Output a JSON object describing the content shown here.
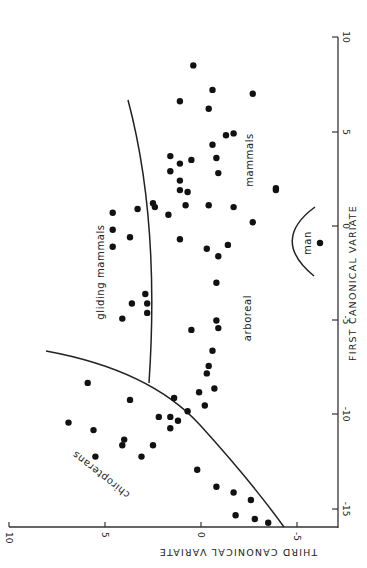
{
  "chart_data": {
    "type": "scatter",
    "title": "",
    "orientation_note": "figure printed rotated 90 degrees clockwise",
    "xlabel": "FIRST CANONICAL VARIATE",
    "ylabel": "THIRD CANONICAL VARIATE",
    "xlim": [
      -16,
      10
    ],
    "ylim": [
      -7,
      10
    ],
    "x_ticks": [
      -15,
      -10,
      -5,
      0,
      5,
      10
    ],
    "y_ticks": [
      -5,
      0,
      5,
      10
    ],
    "x_tick_labels": [
      "-15",
      "-10",
      "-5",
      "0",
      "5",
      "10"
    ],
    "y_tick_labels": [
      "-5",
      "0",
      "5",
      "10"
    ],
    "grid": false,
    "legend": null,
    "region_labels": [
      "chiropterans",
      "gliding mammals",
      "arboreal",
      "mammals",
      "man"
    ],
    "points": [
      {
        "x": 8.5,
        "y": 0.4
      },
      {
        "x": 7.2,
        "y": -0.6
      },
      {
        "x": 7.0,
        "y": -2.7
      },
      {
        "x": 6.6,
        "y": 1.1
      },
      {
        "x": 6.2,
        "y": -0.4
      },
      {
        "x": 4.8,
        "y": -1.3
      },
      {
        "x": 4.9,
        "y": -1.7
      },
      {
        "x": 4.3,
        "y": -0.6
      },
      {
        "x": 3.7,
        "y": 1.6
      },
      {
        "x": 3.3,
        "y": 1.1
      },
      {
        "x": 3.5,
        "y": 0.5
      },
      {
        "x": 3.6,
        "y": -0.8
      },
      {
        "x": 2.8,
        "y": -0.9
      },
      {
        "x": 2.0,
        "y": -3.9
      },
      {
        "x": 1.9,
        "y": -3.9
      },
      {
        "x": 2.9,
        "y": 1.6
      },
      {
        "x": 2.4,
        "y": 1.1
      },
      {
        "x": 1.9,
        "y": 1.1
      },
      {
        "x": 1.8,
        "y": 0.7
      },
      {
        "x": 1.1,
        "y": 0.8
      },
      {
        "x": 1.0,
        "y": 2.4
      },
      {
        "x": 1.1,
        "y": -0.4
      },
      {
        "x": 1.0,
        "y": -1.7
      },
      {
        "x": 0.2,
        "y": -2.7
      },
      {
        "x": 0.7,
        "y": 4.6
      },
      {
        "x": 0.9,
        "y": 3.3
      },
      {
        "x": 1.2,
        "y": 2.5
      },
      {
        "x": 0.6,
        "y": 1.7
      },
      {
        "x": -0.2,
        "y": 4.6
      },
      {
        "x": -0.6,
        "y": 3.7
      },
      {
        "x": -0.7,
        "y": 1.1
      },
      {
        "x": -1.2,
        "y": -0.3
      },
      {
        "x": -1.0,
        "y": -1.4
      },
      {
        "x": -1.6,
        "y": -0.9
      },
      {
        "x": -1.1,
        "y": 4.6
      },
      {
        "x": -3.0,
        "y": -0.8
      },
      {
        "x": -3.6,
        "y": 2.9
      },
      {
        "x": -4.1,
        "y": 2.8
      },
      {
        "x": -4.1,
        "y": 3.6
      },
      {
        "x": -4.6,
        "y": 2.8
      },
      {
        "x": -4.9,
        "y": 4.1
      },
      {
        "x": -5.0,
        "y": -0.8
      },
      {
        "x": -5.4,
        "y": -0.9
      },
      {
        "x": -5.5,
        "y": 0.5
      },
      {
        "x": -6.6,
        "y": -0.6
      },
      {
        "x": -7.4,
        "y": -0.4
      },
      {
        "x": -7.8,
        "y": -0.3
      },
      {
        "x": -8.6,
        "y": -0.7
      },
      {
        "x": -8.3,
        "y": 5.9
      },
      {
        "x": -8.8,
        "y": 0.1
      },
      {
        "x": -9.1,
        "y": 1.4
      },
      {
        "x": -9.2,
        "y": 3.7
      },
      {
        "x": -9.5,
        "y": -0.2
      },
      {
        "x": -9.8,
        "y": 0.7
      },
      {
        "x": -10.1,
        "y": 2.2
      },
      {
        "x": -10.1,
        "y": 1.6
      },
      {
        "x": -10.3,
        "y": 1.2
      },
      {
        "x": -10.4,
        "y": 6.9
      },
      {
        "x": -10.7,
        "y": 1.6
      },
      {
        "x": -10.8,
        "y": 5.6
      },
      {
        "x": -11.3,
        "y": 4.0
      },
      {
        "x": -11.6,
        "y": 4.1
      },
      {
        "x": -11.6,
        "y": 2.5
      },
      {
        "x": -12.2,
        "y": 5.5
      },
      {
        "x": -12.2,
        "y": 3.1
      },
      {
        "x": -12.9,
        "y": 0.2
      },
      {
        "x": -13.8,
        "y": -0.8
      },
      {
        "x": -14.1,
        "y": -1.7
      },
      {
        "x": -14.5,
        "y": -2.6
      },
      {
        "x": -15.3,
        "y": -1.8
      },
      {
        "x": -15.5,
        "y": -2.8
      },
      {
        "x": -15.7,
        "y": -3.5
      }
    ],
    "man_point": {
      "x": -0.9,
      "y": -6.2
    },
    "boundaries": [
      {
        "name": "chiropterans-boundary",
        "path_xy": [
          [
            -6.6,
            4.0
          ],
          [
            -8.5,
            2.7
          ],
          [
            -10.5,
            0.1
          ],
          [
            -13,
            -2.4
          ],
          [
            -15.9,
            -4.3
          ]
        ]
      },
      {
        "name": "gliding-arboreal-boundary",
        "path_xy": [
          [
            6.5,
            3.8
          ],
          [
            3,
            2.5
          ],
          [
            0,
            2.0
          ],
          [
            -4,
            1.9
          ],
          [
            -8.5,
            2.7
          ]
        ]
      },
      {
        "name": "man-boundary",
        "path_xy": [
          [
            1.0,
            -5.9
          ],
          [
            -0.7,
            -4.8
          ],
          [
            -2.6,
            -5.9
          ]
        ]
      }
    ]
  },
  "labels": {
    "x_axis_title": "FIRST CANONICAL VARIATE",
    "y_axis_title": "THIRD CANONICAL VARIATE",
    "chiropterans": "chiropterans",
    "gliding": "gliding mammals",
    "arboreal": "arboreal",
    "mammals": "mammals",
    "man": "man",
    "x_ticks": [
      "-15",
      "-10",
      "-5",
      "0",
      "5",
      "10"
    ],
    "y_ticks": [
      "10",
      "5",
      "0",
      "-5"
    ]
  }
}
